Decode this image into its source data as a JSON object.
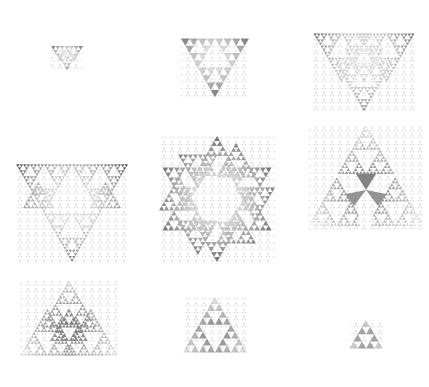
{
  "figure": {
    "width": 429,
    "height": 387,
    "background": "#ffffff",
    "grid": {
      "rows": 3,
      "cols": 3
    },
    "palette": {
      "dark": "#3a3a3a",
      "mid": "#7a7a7a",
      "light": "#c8c8c8",
      "paper": "#f2f2f2"
    }
  },
  "panels": [
    {
      "id": 1,
      "row": 0,
      "col": 0,
      "shape": "inverted-trilobe",
      "cx": 67,
      "cy": 55,
      "size": 32,
      "hole": "none",
      "depth": 1
    },
    {
      "id": 2,
      "row": 0,
      "col": 1,
      "shape": "inverted-triangle",
      "cx": 215,
      "cy": 58,
      "size": 68,
      "hole": "none",
      "depth": 2
    },
    {
      "id": 3,
      "row": 0,
      "col": 2,
      "shape": "inverted-trilobe",
      "cx": 364,
      "cy": 62,
      "size": 102,
      "hole": "none",
      "depth": 3
    },
    {
      "id": 4,
      "row": 1,
      "col": 0,
      "shape": "three-lobes-triangle-hole",
      "cx": 72,
      "cy": 205,
      "size": 112,
      "hole": "triangle",
      "depth": 3
    },
    {
      "id": 5,
      "row": 1,
      "col": 1,
      "shape": "hexagonal-ring",
      "cx": 217,
      "cy": 199,
      "size": 110,
      "hole": "hexagon",
      "depth": 3
    },
    {
      "id": 6,
      "row": 1,
      "col": 2,
      "shape": "three-upright-triangles",
      "cx": 366,
      "cy": 188,
      "size": 108,
      "hole": "center",
      "depth": 3
    },
    {
      "id": 7,
      "row": 2,
      "col": 0,
      "shape": "upright-trilobe",
      "cx": 69,
      "cy": 328,
      "size": 98,
      "hole": "none",
      "depth": 3
    },
    {
      "id": 8,
      "row": 2,
      "col": 1,
      "shape": "upright-triangle",
      "cx": 215,
      "cy": 334,
      "size": 64,
      "hole": "none",
      "depth": 2
    },
    {
      "id": 9,
      "row": 2,
      "col": 2,
      "shape": "upright-triangle",
      "cx": 366,
      "cy": 339,
      "size": 33,
      "hole": "none",
      "depth": 1
    }
  ]
}
